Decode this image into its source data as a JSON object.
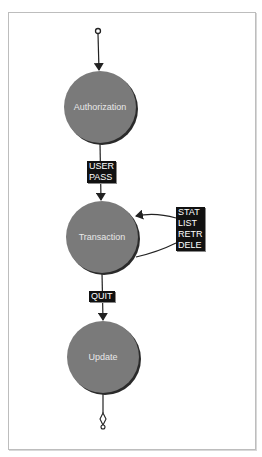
{
  "diagram": {
    "colors": {
      "state_fill": "#7a7a7a",
      "state_shadow": "#2a2a2a",
      "label_bg": "#111111",
      "label_text": "#ffffff",
      "edge": "#222222",
      "frame": "#bdbdbd"
    },
    "states": [
      {
        "id": "authorization",
        "label": "Authorization"
      },
      {
        "id": "transaction",
        "label": "Transaction"
      },
      {
        "id": "update",
        "label": "Update"
      }
    ],
    "transitions": [
      {
        "from": "start",
        "to": "authorization",
        "commands": []
      },
      {
        "from": "authorization",
        "to": "transaction",
        "commands": [
          "USER",
          "PASS"
        ]
      },
      {
        "from": "transaction",
        "to": "transaction",
        "commands": [
          "STAT",
          "LIST",
          "RETR",
          "DELE"
        ]
      },
      {
        "from": "transaction",
        "to": "update",
        "commands": [
          "QUIT"
        ]
      },
      {
        "from": "update",
        "to": "end",
        "commands": []
      }
    ]
  }
}
